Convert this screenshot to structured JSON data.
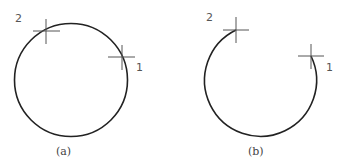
{
  "figures": [
    {
      "id": "a",
      "caption": "(a)",
      "shape": "full circle",
      "points": [
        {
          "label": "1",
          "position": "right, on circle"
        },
        {
          "label": "2",
          "position": "upper-left, on circle"
        }
      ]
    },
    {
      "id": "b",
      "caption": "(b)",
      "shape": "arc from point 1 clockwise... drawn counterclockwise to point 2 (open arc, gap at top)",
      "points": [
        {
          "label": "1",
          "position": "right, arc endpoint"
        },
        {
          "label": "2",
          "position": "upper-left, arc endpoint"
        }
      ]
    }
  ],
  "colors": {
    "stroke": "#222222",
    "cross": "#555555",
    "text": "#555555"
  }
}
